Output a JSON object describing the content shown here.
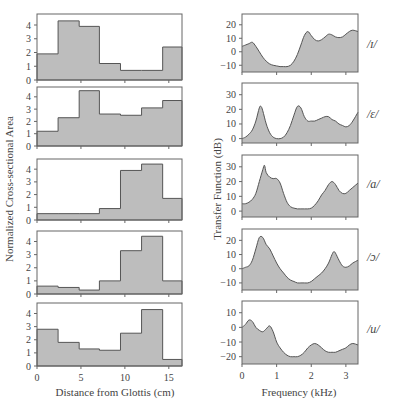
{
  "figure": {
    "left_ylabel": "Normalized Cross-sectional Area",
    "left_xlabel": "Distance from Glottis (cm)",
    "right_ylabel": "Transfer Function (dB)",
    "right_xlabel": "Frequency (kHz)",
    "vowels": [
      "/ɪ/",
      "/ɛ/",
      "/a/",
      "/ɔ/",
      "/u/"
    ]
  },
  "chart_data": [
    {
      "type": "area",
      "title": "Vocal tract area functions",
      "xlabel": "Distance from Glottis (cm)",
      "ylabel": "Normalized Cross-sectional Area",
      "x_ticks": [
        0,
        5,
        10,
        15
      ],
      "xlim": [
        0,
        16.5
      ],
      "y_ticks": [
        0,
        1,
        2,
        3,
        4
      ],
      "ylim": [
        0,
        4.8
      ],
      "panels": [
        {
          "vowel": "/ɪ/",
          "edges": [
            0,
            2.4,
            4.8,
            7.1,
            9.5,
            11.9,
            14.3,
            16.5
          ],
          "values": [
            1.9,
            4.3,
            3.9,
            1.2,
            0.7,
            0.7,
            2.4
          ]
        },
        {
          "vowel": "/ɛ/",
          "edges": [
            0,
            2.4,
            4.8,
            7.1,
            9.5,
            11.9,
            14.3,
            16.5
          ],
          "values": [
            1.2,
            2.3,
            4.5,
            2.6,
            2.5,
            3.1,
            3.7
          ]
        },
        {
          "vowel": "/a/",
          "edges": [
            0,
            2.4,
            4.8,
            7.1,
            9.5,
            11.9,
            14.3,
            16.5
          ],
          "values": [
            0.5,
            0.5,
            0.5,
            0.9,
            3.9,
            4.4,
            1.7
          ]
        },
        {
          "vowel": "/ɔ/",
          "edges": [
            0,
            2.4,
            4.8,
            7.1,
            9.5,
            11.9,
            14.3,
            16.5
          ],
          "values": [
            0.6,
            0.5,
            0.3,
            1.0,
            3.3,
            4.4,
            1.0
          ]
        },
        {
          "vowel": "/u/",
          "edges": [
            0,
            2.4,
            4.8,
            7.1,
            9.5,
            11.9,
            14.3,
            16.5
          ],
          "values": [
            2.8,
            1.8,
            1.3,
            1.2,
            2.5,
            4.3,
            0.5
          ]
        }
      ]
    },
    {
      "type": "area",
      "title": "Transfer functions",
      "xlabel": "Frequency (kHz)",
      "ylabel": "Transfer Function (dB)",
      "x_ticks": [
        0,
        1,
        2,
        3
      ],
      "xlim": [
        0,
        3.35
      ],
      "panels": [
        {
          "vowel": "/ɪ/",
          "ylim": [
            -15,
            28
          ],
          "y_ticks": [
            -10,
            0,
            10,
            20
          ],
          "x": [
            0,
            0.1,
            0.2,
            0.3,
            0.4,
            0.5,
            0.6,
            0.7,
            0.8,
            0.9,
            1.0,
            1.1,
            1.2,
            1.3,
            1.4,
            1.5,
            1.6,
            1.7,
            1.8,
            1.9,
            2.0,
            2.1,
            2.2,
            2.3,
            2.4,
            2.5,
            2.6,
            2.7,
            2.8,
            2.9,
            3.0,
            3.1,
            3.2,
            3.35
          ],
          "y": [
            4,
            5,
            6,
            7,
            4,
            0,
            -4,
            -7,
            -9,
            -10,
            -10.5,
            -11,
            -11,
            -11,
            -10,
            -7,
            -2,
            5,
            12,
            15,
            12,
            9,
            8,
            9,
            11,
            13,
            12.5,
            11,
            10.5,
            11,
            13,
            15,
            16,
            15
          ]
        },
        {
          "vowel": "/ɛ/",
          "ylim": [
            -3,
            38
          ],
          "y_ticks": [
            0,
            10,
            20,
            30
          ],
          "x": [
            0,
            0.1,
            0.2,
            0.3,
            0.4,
            0.5,
            0.55,
            0.6,
            0.7,
            0.8,
            0.9,
            1.0,
            1.1,
            1.2,
            1.3,
            1.4,
            1.5,
            1.6,
            1.7,
            1.8,
            1.9,
            2.0,
            2.1,
            2.2,
            2.3,
            2.4,
            2.5,
            2.6,
            2.7,
            2.8,
            2.9,
            3.0,
            3.1,
            3.2,
            3.35
          ],
          "y": [
            0,
            1,
            3,
            6,
            12,
            21,
            22,
            19,
            10,
            4,
            1,
            0,
            0,
            1,
            4,
            9,
            16,
            22,
            21,
            15,
            12,
            12,
            12,
            13,
            14,
            15,
            15,
            13,
            12,
            10,
            9,
            8,
            9,
            12,
            18
          ]
        },
        {
          "vowel": "/a/",
          "ylim": [
            -4,
            38
          ],
          "y_ticks": [
            0,
            10,
            20,
            30
          ],
          "x": [
            0,
            0.1,
            0.2,
            0.3,
            0.4,
            0.5,
            0.6,
            0.65,
            0.7,
            0.8,
            0.9,
            1.0,
            1.1,
            1.2,
            1.3,
            1.4,
            1.5,
            1.6,
            1.7,
            1.8,
            1.9,
            2.0,
            2.1,
            2.2,
            2.3,
            2.4,
            2.5,
            2.6,
            2.7,
            2.8,
            2.9,
            3.0,
            3.1,
            3.2,
            3.35
          ],
          "y": [
            5,
            5,
            6,
            8,
            12,
            20,
            28,
            31,
            26,
            23,
            22,
            22,
            19,
            12,
            6,
            3,
            2,
            1.5,
            1.5,
            1.5,
            1.5,
            2,
            4,
            7,
            11,
            14,
            18,
            20,
            18,
            14,
            12,
            12,
            14,
            16,
            19
          ]
        },
        {
          "vowel": "/ɔ/",
          "ylim": [
            -15,
            28
          ],
          "y_ticks": [
            -10,
            0,
            10,
            20
          ],
          "x": [
            0,
            0.1,
            0.2,
            0.3,
            0.4,
            0.5,
            0.6,
            0.7,
            0.8,
            0.9,
            1.0,
            1.1,
            1.2,
            1.3,
            1.4,
            1.5,
            1.6,
            1.7,
            1.8,
            1.9,
            2.0,
            2.1,
            2.2,
            2.3,
            2.4,
            2.5,
            2.6,
            2.65,
            2.7,
            2.8,
            2.9,
            3.0,
            3.1,
            3.2,
            3.35
          ],
          "y": [
            0,
            1,
            2,
            6,
            14,
            22,
            22,
            17,
            14,
            9,
            4,
            0,
            -3,
            -6,
            -8,
            -9,
            -10,
            -10,
            -10,
            -10,
            -9,
            -7,
            -5,
            -3,
            0,
            4,
            10,
            12,
            11,
            6,
            2,
            1,
            2,
            4,
            6
          ]
        },
        {
          "vowel": "/u/",
          "ylim": [
            -25,
            18
          ],
          "y_ticks": [
            -20,
            -10,
            0,
            10
          ],
          "x": [
            0,
            0.1,
            0.2,
            0.3,
            0.4,
            0.5,
            0.6,
            0.7,
            0.8,
            0.9,
            1.0,
            1.1,
            1.2,
            1.3,
            1.4,
            1.5,
            1.6,
            1.7,
            1.8,
            1.9,
            2.0,
            2.1,
            2.2,
            2.3,
            2.4,
            2.5,
            2.6,
            2.7,
            2.8,
            2.9,
            3.0,
            3.1,
            3.2,
            3.35
          ],
          "y": [
            0,
            2,
            5,
            4,
            0,
            -2,
            -3,
            -1,
            1,
            -3,
            -10,
            -14,
            -17,
            -19,
            -20,
            -20,
            -20,
            -19,
            -17,
            -14,
            -12,
            -11,
            -12,
            -14,
            -16,
            -17,
            -17,
            -17,
            -16,
            -15,
            -14,
            -12,
            -11,
            -12
          ]
        }
      ]
    }
  ]
}
